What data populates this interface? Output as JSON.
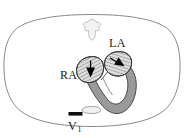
{
  "figure": {
    "type": "anatomical-diagram",
    "background_color": "#ffffff"
  },
  "labels": {
    "left_atrium": "LA",
    "right_atrium": "RA",
    "electrode_lead": "V",
    "electrode_lead_subscript": "1"
  },
  "structures": {
    "thorax": {
      "name": "thorax-outline",
      "stroke": "#8a8a8a",
      "fill": "#ffffff"
    },
    "vertebra": {
      "name": "vertebra",
      "stroke": "#b0b0b0",
      "fill": "#f2f2f2"
    },
    "right_atrium": {
      "name": "right-atrium",
      "stroke": "#3c3c3c",
      "fill": "#dcdcdc",
      "hatching": "true"
    },
    "left_atrium": {
      "name": "left-atrium",
      "stroke": "#3c3c3c",
      "fill": "#dcdcdc",
      "hatching": "true"
    },
    "ventricles": {
      "name": "ventricular-myocardium",
      "stroke": "#4a4a4a",
      "fill": "#9a9a9a"
    },
    "esophagus": {
      "name": "esophagus",
      "stroke": "#9a9a9a",
      "fill": "#f0f0f0"
    },
    "electrode": {
      "name": "v1-electrode",
      "fill": "#111111"
    },
    "ra_arrow": {
      "name": "ra-depolarization-arrow",
      "fill": "#000000",
      "direction": "down"
    },
    "la_arrow": {
      "name": "la-depolarization-arrow",
      "fill": "#000000",
      "direction": "down-right"
    }
  }
}
